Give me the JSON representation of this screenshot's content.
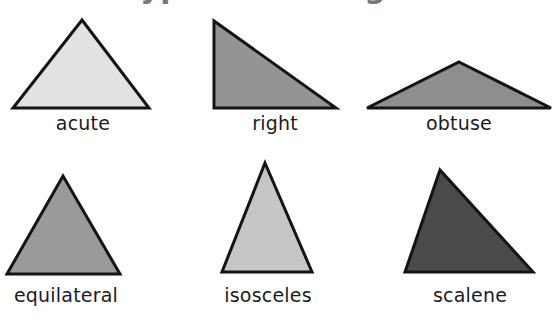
{
  "page": {
    "title": "Types of Triangles",
    "title_color": "#7a7a7a",
    "background": "#ffffff",
    "width": 559,
    "height": 324
  },
  "figures": [
    {
      "id": "acute",
      "label": "acute",
      "fill": "#e2e2e2",
      "stroke": "#141414",
      "stroke_width": 3,
      "box": {
        "left": 8,
        "top": 16,
        "width": 150,
        "height": 100
      },
      "points": "74,4 141,92 5,92",
      "caption_top": 112
    },
    {
      "id": "right",
      "label": "right",
      "fill": "#949494",
      "stroke": "#141414",
      "stroke_width": 3,
      "box": {
        "left": 208,
        "top": 16,
        "width": 134,
        "height": 100
      },
      "points": "6,5 6,92 128,92",
      "caption_top": 112
    },
    {
      "id": "obtuse",
      "label": "obtuse",
      "fill": "#8e8e8e",
      "stroke": "#141414",
      "stroke_width": 3,
      "box": {
        "left": 362,
        "top": 56,
        "width": 194,
        "height": 60
      },
      "points": "97,6 189,52 5,52",
      "caption_top": 112
    },
    {
      "id": "equilateral",
      "label": "equilateral",
      "fill": "#9a9a9a",
      "stroke": "#141414",
      "stroke_width": 3,
      "box": {
        "left": 4,
        "top": 170,
        "width": 124,
        "height": 110
      },
      "points": "59,6 116,104 3,104",
      "caption_top": 284
    },
    {
      "id": "isosceles",
      "label": "isosceles",
      "fill": "#c6c6c6",
      "stroke": "#141414",
      "stroke_width": 3,
      "box": {
        "left": 218,
        "top": 158,
        "width": 100,
        "height": 122
      },
      "points": "47,5 94,114 4,114",
      "caption_top": 284
    },
    {
      "id": "scalene",
      "label": "scalene",
      "fill": "#4a4a4a",
      "stroke": "#141414",
      "stroke_width": 3,
      "box": {
        "left": 400,
        "top": 164,
        "width": 140,
        "height": 116
      },
      "points": "40,6 133,108 5,108",
      "caption_top": 284
    }
  ]
}
